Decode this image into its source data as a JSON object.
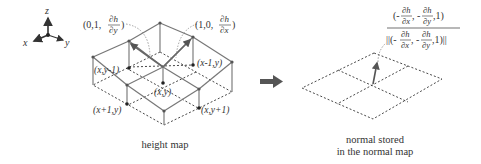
{
  "axes": {
    "x": "x",
    "y": "y",
    "z": "z"
  },
  "height_map": {
    "labels": {
      "tangent_y": [
        "(0,1,",
        "∂h",
        "∂y",
        ")"
      ],
      "tangent_x": [
        "(1,0,",
        "∂h",
        "∂x",
        ")"
      ],
      "x_ym1": "(x,y-1)",
      "xm1_y": "(x-1,y)",
      "x_y": "(x,y)",
      "xp1_y": "(x+1,y)",
      "x_yp1": "(x,y+1)"
    },
    "caption": "height map"
  },
  "normal_map": {
    "formula": {
      "numerator": [
        "(-",
        "∂h",
        "∂x",
        ", -",
        "∂h",
        "∂y",
        ",1)"
      ],
      "denominator": [
        "||(-",
        "∂h",
        "∂x",
        ", -",
        "∂h",
        "∂y",
        ",1)||"
      ]
    },
    "caption_line1": "normal stored",
    "caption_line2": "in the normal map"
  },
  "colors": {
    "line": "#777777",
    "dash": "#333333",
    "point": "#222222",
    "arrow": "#555555"
  }
}
